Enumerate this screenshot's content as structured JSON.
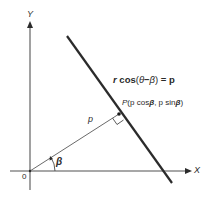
{
  "diagram": {
    "axes": {
      "x_label": "X",
      "y_label": "Y",
      "origin_label": "0"
    },
    "equation": {
      "r": "r",
      "cos": "cos",
      "open": "(",
      "theta": "θ",
      "minus": "−",
      "beta": "β",
      "close": ")",
      "equals": "=",
      "p": "p"
    },
    "point": {
      "name": "P",
      "open": "(",
      "p1": "p",
      "cos": "cos",
      "beta1": "β",
      "comma": ",",
      "p2": "p",
      "sin": "sin",
      "beta2": "β",
      "close": ")"
    },
    "segment_label": "p",
    "angle_label": "β",
    "colors": {
      "line": "#2b2b2b",
      "axis": "#8a8a8a",
      "text": "#2a2a2a"
    }
  }
}
